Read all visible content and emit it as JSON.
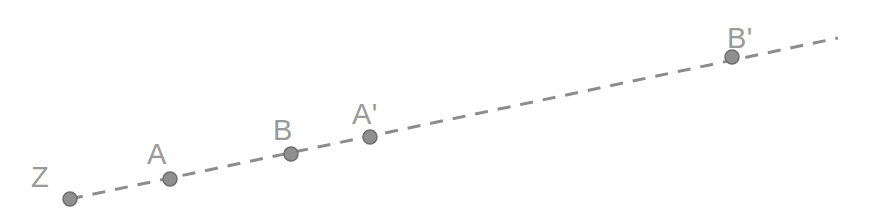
{
  "figure": {
    "title": "",
    "type": "geometry-diagram",
    "canvas": {
      "width": 869,
      "height": 219,
      "background": "#ffffff"
    },
    "line": {
      "name": "dashed-ray",
      "x1": 70,
      "y1": 199,
      "x2": 838,
      "y2": 38,
      "color": "#8c8c8c",
      "stroke_width": 3,
      "dash": "13 10",
      "style": "dashed"
    },
    "point_style": {
      "radius": 7,
      "fill": "#8f8f8f",
      "stroke": "#6e6e6e",
      "stroke_width": 1.5
    },
    "label_color": "#9a9a9a",
    "label_font_size": 29,
    "points": [
      {
        "id": "Z",
        "label": "Z",
        "cx": 70,
        "cy": 199,
        "label_x": 31,
        "label_y": 187
      },
      {
        "id": "A",
        "label": "A",
        "cx": 170,
        "cy": 179,
        "label_x": 147,
        "label_y": 164
      },
      {
        "id": "B",
        "label": "B",
        "cx": 291,
        "cy": 154,
        "label_x": 273,
        "label_y": 140
      },
      {
        "id": "Ap",
        "label": "A'",
        "cx": 370,
        "cy": 137,
        "label_x": 352,
        "label_y": 124
      },
      {
        "id": "Bp",
        "label": "B'",
        "cx": 732,
        "cy": 57,
        "label_x": 727,
        "label_y": 48
      }
    ]
  }
}
